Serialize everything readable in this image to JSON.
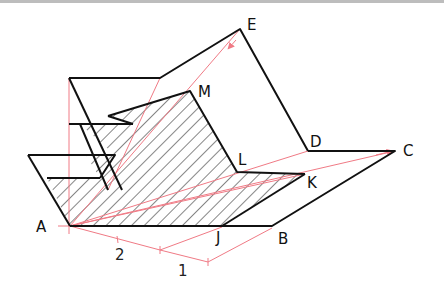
{
  "figure": {
    "colors": {
      "outline": "#111111",
      "construction": "#f07a85",
      "hatch": "#222222",
      "background": "#ffffff"
    },
    "points": {
      "A": {
        "label": "A",
        "x": 70,
        "y": 226
      },
      "B": {
        "label": "B",
        "x": 272,
        "y": 226
      },
      "C": {
        "label": "C",
        "x": 395,
        "y": 151
      },
      "D": {
        "label": "D",
        "x": 308,
        "y": 151
      },
      "E": {
        "label": "E",
        "x": 240,
        "y": 29
      },
      "M": {
        "label": "M",
        "x": 190,
        "y": 91
      },
      "L": {
        "label": "L",
        "x": 237,
        "y": 172
      },
      "K": {
        "label": "K",
        "x": 305,
        "y": 174
      },
      "J": {
        "label": "J",
        "x": 222,
        "y": 226
      }
    },
    "dimensions": [
      {
        "label": "2",
        "segment": "A to first tick"
      },
      {
        "label": "1",
        "segment": "first tick to second tick"
      }
    ]
  }
}
